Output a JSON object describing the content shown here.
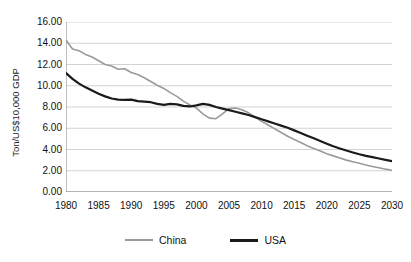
{
  "chart_data": {
    "type": "line",
    "title": "",
    "subtitle": "",
    "xlabel": "",
    "ylabel": "Ton/US$10,000 GDP",
    "xlim": [
      1980,
      2030
    ],
    "ylim": [
      0.0,
      16.0
    ],
    "ytick_step": 2.0,
    "xtick_step": 5,
    "minor_xtick_step": 1,
    "grid": "horizontal",
    "legend_position": "bottom",
    "y_ticks": [
      "0.00",
      "2.00",
      "4.00",
      "6.00",
      "8.00",
      "10.00",
      "12.00",
      "14.00",
      "16.00"
    ],
    "x_ticks": [
      "1980",
      "1985",
      "1990",
      "1995",
      "2000",
      "2005",
      "2010",
      "2015",
      "2020",
      "2025",
      "2030"
    ],
    "colors": {
      "china": "#9a9a9a",
      "usa": "#1a1a1a",
      "grid": "#c8c8c8",
      "axis": "#808080"
    },
    "x": [
      1980,
      1981,
      1982,
      1983,
      1984,
      1985,
      1986,
      1987,
      1988,
      1989,
      1990,
      1991,
      1992,
      1993,
      1994,
      1995,
      1996,
      1997,
      1998,
      1999,
      2000,
      2001,
      2002,
      2003,
      2004,
      2005,
      2006,
      2007,
      2008,
      2009,
      2010,
      2011,
      2012,
      2013,
      2014,
      2015,
      2016,
      2017,
      2018,
      2019,
      2020,
      2021,
      2022,
      2023,
      2024,
      2025,
      2026,
      2027,
      2028,
      2029,
      2030
    ],
    "series": [
      {
        "name": "China",
        "color": "#9a9a9a",
        "width": 1.6,
        "values": [
          14.3,
          13.45,
          13.3,
          12.95,
          12.7,
          12.35,
          12.0,
          11.85,
          11.55,
          11.6,
          11.25,
          11.05,
          10.75,
          10.4,
          10.05,
          9.75,
          9.35,
          9.0,
          8.55,
          8.2,
          7.9,
          7.35,
          6.95,
          6.9,
          7.35,
          7.85,
          7.9,
          7.75,
          7.45,
          7.05,
          6.65,
          6.3,
          5.95,
          5.6,
          5.25,
          4.95,
          4.65,
          4.35,
          4.1,
          3.85,
          3.6,
          3.4,
          3.2,
          3.0,
          2.85,
          2.7,
          2.55,
          2.4,
          2.28,
          2.15,
          2.05
        ]
      },
      {
        "name": "USA",
        "color": "#1a1a1a",
        "width": 2.2,
        "values": [
          11.2,
          10.65,
          10.2,
          9.85,
          9.55,
          9.25,
          9.0,
          8.8,
          8.7,
          8.68,
          8.7,
          8.55,
          8.5,
          8.45,
          8.3,
          8.2,
          8.3,
          8.25,
          8.1,
          8.05,
          8.15,
          8.3,
          8.2,
          8.0,
          7.85,
          7.7,
          7.55,
          7.4,
          7.25,
          7.05,
          6.85,
          6.65,
          6.45,
          6.25,
          6.05,
          5.8,
          5.55,
          5.3,
          5.05,
          4.8,
          4.55,
          4.3,
          4.1,
          3.9,
          3.72,
          3.55,
          3.4,
          3.28,
          3.15,
          3.02,
          2.9
        ]
      }
    ]
  },
  "legend": {
    "items": [
      {
        "label": "China",
        "key": "china"
      },
      {
        "label": "USA",
        "key": "usa"
      }
    ]
  }
}
